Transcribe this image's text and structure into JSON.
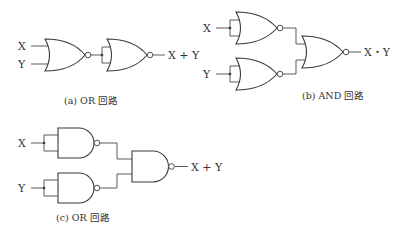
{
  "diagrams": {
    "a": {
      "caption": "(a) OR 回路",
      "input_x": "X",
      "input_y": "Y",
      "output": "X + Y",
      "gates": [
        "NOR",
        "NOR"
      ]
    },
    "b": {
      "caption": "(b) AND 回路",
      "input_x": "X",
      "input_y": "Y",
      "output": "X・Y",
      "gates": [
        "NOR",
        "NOR",
        "NOR"
      ]
    },
    "c": {
      "caption": "(c) OR 回路",
      "input_x": "X",
      "input_y": "Y",
      "output": "X + Y",
      "gates": [
        "NAND",
        "NAND",
        "NAND"
      ]
    }
  },
  "colors": {
    "line": "#3a3a3a",
    "text": "#333333",
    "background": "#ffffff"
  }
}
